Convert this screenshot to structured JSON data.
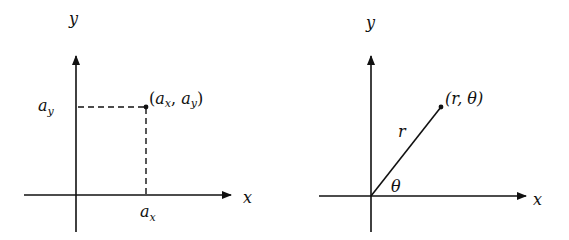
{
  "diagrams": {
    "cartesian": {
      "x_axis_label": "x",
      "y_axis_label": "y",
      "point_label_open": "(",
      "point_a": "a",
      "sub_x": "x",
      "comma": ", ",
      "sub_y": "y",
      "point_label_close": ")",
      "x_tick_label_base": "a",
      "x_tick_label_sub": "x",
      "y_tick_label_base": "a",
      "y_tick_label_sub": "y"
    },
    "polar": {
      "x_axis_label": "x",
      "y_axis_label": "y",
      "point_label": "(r, θ)",
      "radius_label": "r",
      "angle_label": "θ"
    }
  }
}
